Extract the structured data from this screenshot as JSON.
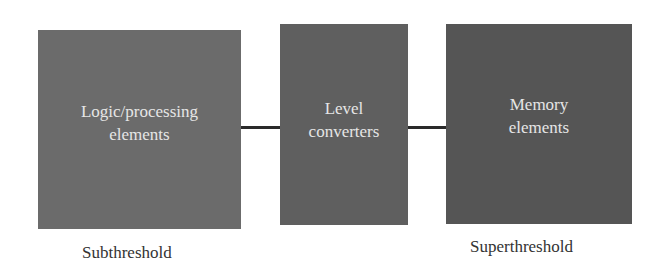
{
  "diagram": {
    "type": "block-diagram",
    "blocks": [
      {
        "id": "logic",
        "lines": [
          "Logic/processing",
          "elements"
        ],
        "color": "#6b6b6b"
      },
      {
        "id": "level",
        "lines": [
          "Level",
          "converters"
        ],
        "color": "#5f5f5f"
      },
      {
        "id": "memory",
        "lines": [
          "Memory",
          "elements"
        ],
        "color": "#555555"
      }
    ],
    "connections": [
      {
        "from": "logic",
        "to": "level"
      },
      {
        "from": "level",
        "to": "memory"
      }
    ],
    "region_labels": {
      "subthreshold": "Subthreshold",
      "superthreshold": "Superthreshold"
    },
    "text_color": "#e6e6e6",
    "connector_color": "#2a2a2a"
  }
}
